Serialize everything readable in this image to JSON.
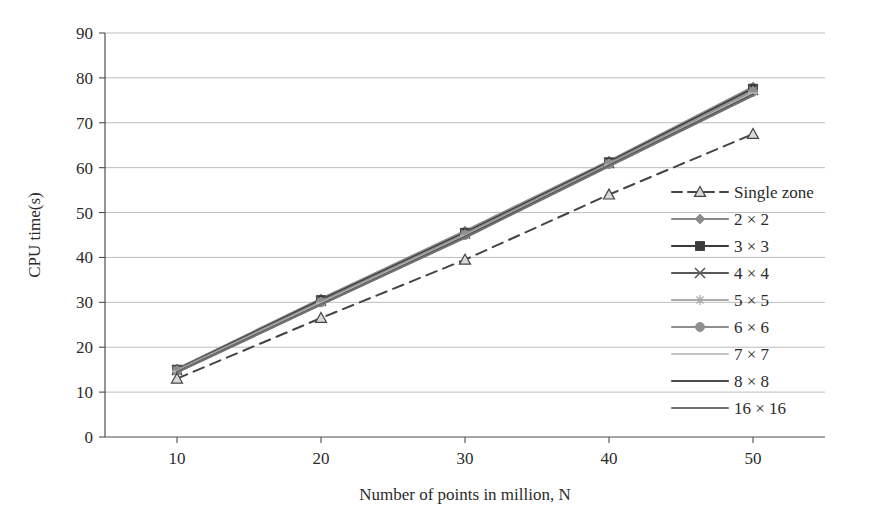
{
  "chart_data": {
    "type": "line",
    "title": "",
    "xlabel": "Number of points in million, N",
    "ylabel": "CPU time(s)",
    "x": [
      10,
      20,
      30,
      40,
      50
    ],
    "xticklabels": [
      "10",
      "20",
      "30",
      "40",
      "50"
    ],
    "yticklabels": [
      "0",
      "10",
      "20",
      "30",
      "40",
      "50",
      "60",
      "70",
      "80",
      "90"
    ],
    "xlim": [
      5,
      55
    ],
    "ylim": [
      0,
      90
    ],
    "ytick_step": 10,
    "grid": "horizontal",
    "legend_position": "right-inside",
    "series": [
      {
        "name": "Single zone",
        "values": [
          13.0,
          26.5,
          39.5,
          54.0,
          67.5
        ],
        "marker": "triangle",
        "dash": "dashed",
        "color": "#444444"
      },
      {
        "name": "2 × 2",
        "values": [
          15.2,
          30.8,
          45.9,
          61.5,
          78.0
        ],
        "marker": "diamond",
        "dash": "solid",
        "color": "#8a8a8a"
      },
      {
        "name": "3 × 3",
        "values": [
          15.0,
          30.5,
          45.5,
          61.2,
          77.6
        ],
        "marker": "square",
        "dash": "solid",
        "color": "#3a3a3a"
      },
      {
        "name": "4 × 4",
        "values": [
          14.9,
          30.3,
          45.3,
          61.0,
          77.3
        ],
        "marker": "cross",
        "dash": "solid",
        "color": "#5a5a5a"
      },
      {
        "name": "5 × 5",
        "values": [
          14.8,
          30.1,
          45.1,
          60.9,
          77.1
        ],
        "marker": "star",
        "dash": "solid",
        "color": "#a8a8a8"
      },
      {
        "name": "6 × 6",
        "values": [
          14.7,
          30.0,
          45.0,
          60.8,
          76.9
        ],
        "marker": "circle",
        "dash": "solid",
        "color": "#8f8f8f"
      },
      {
        "name": "7 × 7",
        "values": [
          14.6,
          29.8,
          44.8,
          60.6,
          76.6
        ],
        "marker": "tick",
        "dash": "solid",
        "color": "#c2c2c2"
      },
      {
        "name": "8 × 8",
        "values": [
          14.5,
          29.6,
          44.6,
          60.5,
          76.3
        ],
        "marker": "none",
        "dash": "solid",
        "color": "#4a4a4a"
      },
      {
        "name": "16 × 16",
        "values": [
          14.4,
          29.5,
          44.4,
          60.3,
          76.1
        ],
        "marker": "none",
        "dash": "solid",
        "color": "#707070"
      }
    ]
  },
  "axes": {
    "y_title": "CPU time(s)",
    "x_title": "Number of points in million, N"
  },
  "colors": {
    "axis": "#4d4d4d",
    "grid": "#b5b5b5",
    "text": "#2b2b2b",
    "background": "#ffffff"
  }
}
